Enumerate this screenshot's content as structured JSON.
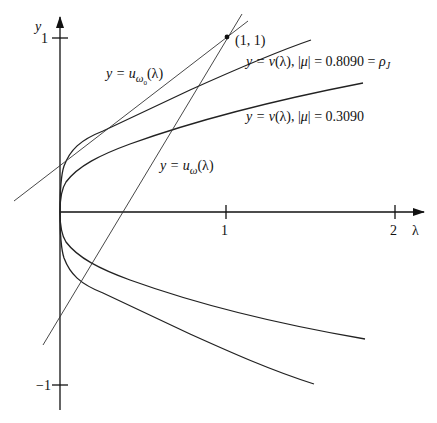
{
  "figure": {
    "axes": {
      "x_label": "λ",
      "y_label": "y",
      "x_ticks": [
        {
          "value": 1,
          "label": "1"
        },
        {
          "value": 2,
          "label": "2"
        }
      ],
      "y_ticks": [
        {
          "value": 1,
          "label": "1"
        },
        {
          "value": -1,
          "label": "−1"
        }
      ]
    },
    "point": {
      "label": "(1, 1)",
      "x": 1,
      "y": 1
    },
    "labels": {
      "u_omega0": {
        "prefix": "y = u",
        "sub": "ω",
        "subsub": "0",
        "suffix": "(λ)"
      },
      "u_omega": {
        "prefix": "y = u",
        "sub": "ω",
        "suffix": "(λ)"
      },
      "v_0809": {
        "text_a": "y = ",
        "v": "v",
        "text_b": "(λ), |",
        "mu": "μ",
        "text_c": "| = 0.8090 = ",
        "rho": "ρ",
        "rho_sub": "J"
      },
      "v_0309": {
        "text_a": "y = ",
        "v": "v",
        "text_b": "(λ), |",
        "mu": "μ",
        "text_c": "| = 0.3090"
      }
    },
    "curves": [
      {
        "name": "v(λ) with |μ| = 0.8090 = ρ_J",
        "mu": 0.809,
        "branches": "upper and lower (symmetric about λ-axis)"
      },
      {
        "name": "v(λ) with |μ| = 0.3090",
        "mu": 0.309,
        "branches": "upper and lower (symmetric about λ-axis)"
      },
      {
        "name": "u_ω0(λ)",
        "type": "line",
        "note": "tangent to upper v curve (|μ|=0.8090), passes through (1,1)"
      },
      {
        "name": "u_ω(λ)",
        "type": "line",
        "note": "steeper line through (1,1)"
      }
    ]
  }
}
